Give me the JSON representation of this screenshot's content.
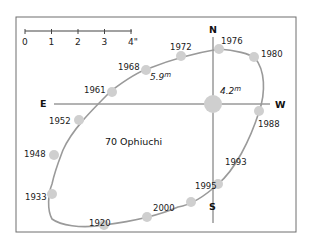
{
  "title": "70 Ophiuchi",
  "colors": {
    "frame": "#6e6e6e",
    "axis": "#555555",
    "orbit": "#9a9a9a",
    "star": "#cfcfcf",
    "text": "#1a1a1a"
  },
  "directions": {
    "north": "N",
    "south": "S",
    "east": "E",
    "west": "W"
  },
  "scale_bar": {
    "ticks": [
      "0",
      "1",
      "2",
      "3",
      "4\""
    ],
    "unit": "arcseconds"
  },
  "primary_star": {
    "magnitude_label": "4.2",
    "magnitude_unit": "m"
  },
  "companion": {
    "magnitude_label": "5.9",
    "magnitude_unit": "m"
  },
  "orbit_points": [
    {
      "year": "1976"
    },
    {
      "year": "1980"
    },
    {
      "year": "1988"
    },
    {
      "year": "1993"
    },
    {
      "year": "1995"
    },
    {
      "year": "2000"
    },
    {
      "year": "1920"
    },
    {
      "year": "1933"
    },
    {
      "year": "1948"
    },
    {
      "year": "1952"
    },
    {
      "year": "1961"
    },
    {
      "year": "1968"
    },
    {
      "year": "1972"
    }
  ]
}
